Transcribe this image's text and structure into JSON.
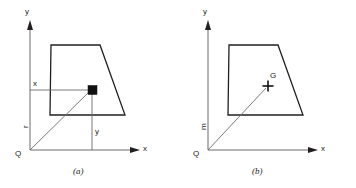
{
  "figure": {
    "background_color": "#ffffff",
    "line_color": "#231f20",
    "thin_line_color": "#6b6b6b",
    "text_color": "#1a1a1a"
  },
  "panel_a": {
    "caption": "(a)",
    "axis_y_label": "y",
    "axis_x_label": "x",
    "origin_label": "Q",
    "vector_label": "r",
    "coord_x_label": "x",
    "coord_y_label": "y",
    "marker_type": "filled-square",
    "geometry": {
      "origin": [
        30,
        150
      ],
      "y_axis_top": [
        30,
        22
      ],
      "x_axis_right": [
        140,
        150
      ],
      "trapezoid": [
        [
          50,
          115
        ],
        [
          51,
          45
        ],
        [
          100,
          45
        ],
        [
          125,
          115
        ]
      ],
      "point": [
        92,
        90
      ]
    }
  },
  "panel_b": {
    "caption": "(b)",
    "axis_y_label": "y",
    "axis_x_label": "x",
    "origin_label": "Q",
    "vector_label": "m",
    "centroid_label": "G",
    "marker_type": "plus-cross",
    "geometry": {
      "origin": [
        208,
        150
      ],
      "y_axis_top": [
        208,
        22
      ],
      "x_axis_right": [
        318,
        150
      ],
      "trapezoid": [
        [
          228,
          115
        ],
        [
          229,
          45
        ],
        [
          278,
          45
        ],
        [
          303,
          115
        ]
      ],
      "point": [
        268,
        86
      ]
    }
  }
}
